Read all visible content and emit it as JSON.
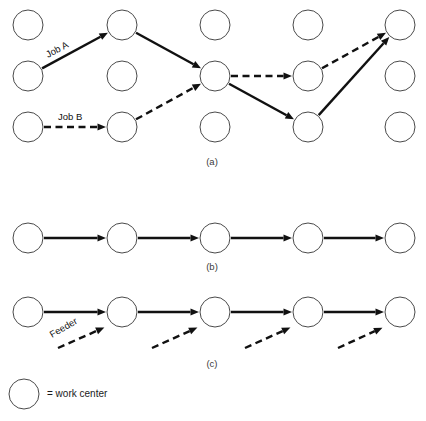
{
  "figure": {
    "geometry": {
      "columns_x": [
        28,
        122,
        215,
        308,
        400
      ],
      "panel_a_rows_y": [
        25,
        76,
        127
      ],
      "panel_b_row_y": 238,
      "panel_c_row_y": 312,
      "node_radius": 15
    },
    "colors": {
      "node_stroke": "#4a4a4a",
      "node_fill": "#ffffff",
      "flow_line": "#111111",
      "caption": "#3a3a3a",
      "background": "#ffffff"
    },
    "panels": [
      {
        "id": "a",
        "caption": "(a)",
        "caption_x": 212,
        "caption_y": 165,
        "description": "job shop - jumbled flow",
        "nodes": [
          {
            "col": 0,
            "row": 0
          },
          {
            "col": 1,
            "row": 0
          },
          {
            "col": 2,
            "row": 0
          },
          {
            "col": 3,
            "row": 0
          },
          {
            "col": 4,
            "row": 0
          },
          {
            "col": 0,
            "row": 1
          },
          {
            "col": 1,
            "row": 1
          },
          {
            "col": 2,
            "row": 1
          },
          {
            "col": 3,
            "row": 1
          },
          {
            "col": 4,
            "row": 1
          },
          {
            "col": 0,
            "row": 2
          },
          {
            "col": 1,
            "row": 2
          },
          {
            "col": 2,
            "row": 2
          },
          {
            "col": 3,
            "row": 2
          },
          {
            "col": 4,
            "row": 2
          }
        ],
        "routes": [
          {
            "name": "job-a-seg-1",
            "style": "solid",
            "from": {
              "col": 0,
              "row": 1
            },
            "to": {
              "col": 1,
              "row": 0
            }
          },
          {
            "name": "job-a-seg-2",
            "style": "solid",
            "from": {
              "col": 1,
              "row": 0
            },
            "to": {
              "col": 2,
              "row": 1
            }
          },
          {
            "name": "job-a-seg-3",
            "style": "solid",
            "from": {
              "col": 2,
              "row": 1
            },
            "to": {
              "col": 3,
              "row": 2
            }
          },
          {
            "name": "job-a-seg-4",
            "style": "solid",
            "from": {
              "col": 3,
              "row": 2
            },
            "to": {
              "col": 4,
              "row": 0
            }
          },
          {
            "name": "job-b-seg-1",
            "style": "dashed",
            "from": {
              "col": 0,
              "row": 2
            },
            "to": {
              "col": 1,
              "row": 2
            }
          },
          {
            "name": "job-b-seg-2",
            "style": "dashed",
            "from": {
              "col": 1,
              "row": 2
            },
            "to": {
              "col": 2,
              "row": 1
            }
          },
          {
            "name": "job-b-seg-3",
            "style": "dashed",
            "from": {
              "col": 2,
              "row": 1
            },
            "to": {
              "col": 3,
              "row": 1
            }
          },
          {
            "name": "job-b-seg-4",
            "style": "dashed",
            "from": {
              "col": 3,
              "row": 1
            },
            "to": {
              "col": 4,
              "row": 0
            }
          }
        ],
        "labels": [
          {
            "name": "job-a-label",
            "text": "Job A",
            "x": 48,
            "y": 58,
            "rotate": -28
          },
          {
            "name": "job-b-label",
            "text": "Job B",
            "x": 58,
            "y": 120,
            "rotate": 0
          }
        ]
      },
      {
        "id": "b",
        "caption": "(b)",
        "caption_x": 212,
        "caption_y": 270,
        "description": "flow shop - straight line flow",
        "nodes": [
          {
            "col": 0,
            "row": 0
          },
          {
            "col": 1,
            "row": 0
          },
          {
            "col": 2,
            "row": 0
          },
          {
            "col": 3,
            "row": 0
          },
          {
            "col": 4,
            "row": 0
          }
        ],
        "routes": [
          {
            "name": "line-seg-1",
            "style": "solid",
            "from": {
              "col": 0,
              "row": 0
            },
            "to": {
              "col": 1,
              "row": 0
            }
          },
          {
            "name": "line-seg-2",
            "style": "solid",
            "from": {
              "col": 1,
              "row": 0
            },
            "to": {
              "col": 2,
              "row": 0
            }
          },
          {
            "name": "line-seg-3",
            "style": "solid",
            "from": {
              "col": 2,
              "row": 0
            },
            "to": {
              "col": 3,
              "row": 0
            }
          },
          {
            "name": "line-seg-4",
            "style": "solid",
            "from": {
              "col": 3,
              "row": 0
            },
            "to": {
              "col": 4,
              "row": 0
            }
          }
        ],
        "labels": []
      },
      {
        "id": "c",
        "caption": "(c)",
        "caption_x": 212,
        "caption_y": 367,
        "description": "flow shop with feeder lines",
        "nodes": [
          {
            "col": 0,
            "row": 0
          },
          {
            "col": 1,
            "row": 0
          },
          {
            "col": 2,
            "row": 0
          },
          {
            "col": 3,
            "row": 0
          },
          {
            "col": 4,
            "row": 0
          }
        ],
        "routes": [
          {
            "name": "main-seg-1",
            "style": "solid",
            "from": {
              "col": 0,
              "row": 0
            },
            "to": {
              "col": 1,
              "row": 0
            }
          },
          {
            "name": "main-seg-2",
            "style": "solid",
            "from": {
              "col": 1,
              "row": 0
            },
            "to": {
              "col": 2,
              "row": 0
            }
          },
          {
            "name": "main-seg-3",
            "style": "solid",
            "from": {
              "col": 2,
              "row": 0
            },
            "to": {
              "col": 3,
              "row": 0
            }
          },
          {
            "name": "main-seg-4",
            "style": "solid",
            "from": {
              "col": 3,
              "row": 0
            },
            "to": {
              "col": 4,
              "row": 0
            }
          }
        ],
        "feeders": [
          {
            "name": "feeder-arrow-1",
            "x1": 58,
            "y1": 348,
            "target_col": 1
          },
          {
            "name": "feeder-arrow-2",
            "x1": 152,
            "y1": 348,
            "target_col": 2
          },
          {
            "name": "feeder-arrow-3",
            "x1": 245,
            "y1": 348,
            "target_col": 3
          },
          {
            "name": "feeder-arrow-4",
            "x1": 338,
            "y1": 348,
            "target_col": 4
          }
        ],
        "labels": [
          {
            "name": "feeder-label",
            "text": "Feeder",
            "x": 52,
            "y": 338,
            "rotate": -30
          }
        ]
      }
    ],
    "legend": {
      "circle": {
        "cx": 24,
        "cy": 394,
        "r": 15
      },
      "text": "= work center",
      "text_x": 47,
      "text_y": 394
    }
  }
}
